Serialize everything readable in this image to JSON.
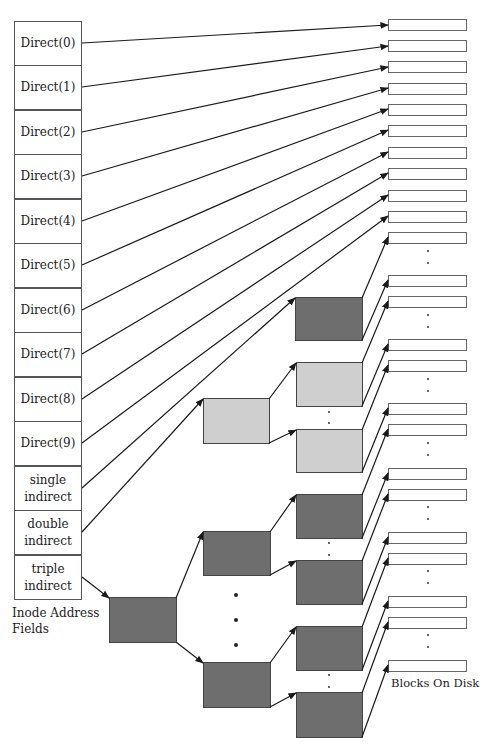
{
  "inode": {
    "rows": [
      {
        "label": "Direct(0)"
      },
      {
        "label": "Direct(1)"
      },
      {
        "label": "Direct(2)"
      },
      {
        "label": "Direct(3)"
      },
      {
        "label": "Direct(4)"
      },
      {
        "label": "Direct(5)"
      },
      {
        "label": "Direct(6)"
      },
      {
        "label": "Direct(7)"
      },
      {
        "label": "Direct(8)"
      },
      {
        "label": "Direct(9)"
      },
      {
        "label": "single\nindirect"
      },
      {
        "label": "double\nindirect"
      },
      {
        "label": "triple\nindirect"
      }
    ],
    "caption": "Inode Address\nFields"
  },
  "disk": {
    "caption": "Blocks On Disk"
  },
  "colors": {
    "dark_block": "#6e6e6e",
    "light_block": "#cfcfcf",
    "line": "#1a1a1a",
    "border": "#555555"
  },
  "index_blocks": {
    "single": {
      "shade": "dark"
    },
    "double": {
      "shade": "light"
    },
    "triple": {
      "shade": "dark"
    }
  }
}
